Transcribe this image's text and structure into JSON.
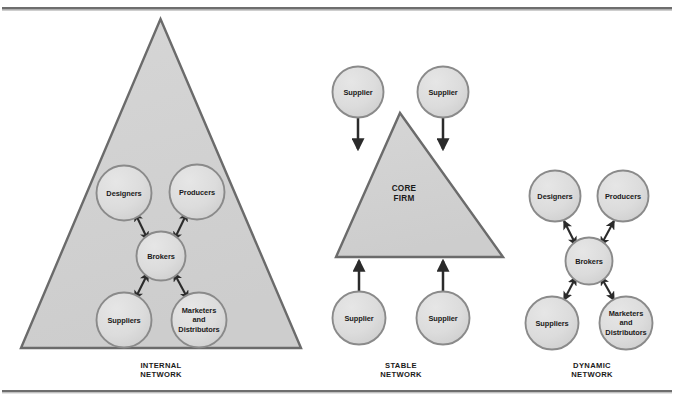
{
  "figure": {
    "type": "diagram",
    "diagram_kind": "organizational-network-forms",
    "panel_count": 3
  },
  "rules": {
    "top_rule": {
      "name": "top-divider"
    },
    "bottom_rule": {
      "name": "bottom-divider"
    }
  },
  "colors": {
    "triangle_fill": "#d2d2d2",
    "triangle_stroke": "#6b6b6b",
    "circle_fill": "#dcdcdc",
    "circle_stroke": "#8a8a8a",
    "arrow": "#2b2b2b",
    "text": "#1a1a1a",
    "rule": "#6e6e6e",
    "page_background": "#ffffff"
  },
  "panels": [
    {
      "id": "internal-network",
      "caption_lines": [
        "INTERNAL",
        "NETWORK"
      ],
      "has_triangle": true,
      "triangle_label": "",
      "nodes": [
        {
          "id": "designers",
          "lines": [
            "Designers"
          ]
        },
        {
          "id": "producers",
          "lines": [
            "Producers"
          ]
        },
        {
          "id": "brokers",
          "lines": [
            "Brokers"
          ]
        },
        {
          "id": "suppliers",
          "lines": [
            "Suppliers"
          ]
        },
        {
          "id": "marketers",
          "lines": [
            "Marketers",
            "and",
            "Distributors"
          ]
        }
      ],
      "connections": [
        {
          "from": "brokers",
          "to": "designers",
          "style": "double-arrow"
        },
        {
          "from": "brokers",
          "to": "producers",
          "style": "double-arrow"
        },
        {
          "from": "brokers",
          "to": "suppliers",
          "style": "double-arrow"
        },
        {
          "from": "brokers",
          "to": "marketers",
          "style": "double-arrow"
        }
      ]
    },
    {
      "id": "stable-network",
      "caption_lines": [
        "STABLE",
        "NETWORK"
      ],
      "has_triangle": true,
      "triangle_label_lines": [
        "CORE",
        "FIRM"
      ],
      "nodes": [
        {
          "id": "supplier-top-left",
          "lines": [
            "Supplier"
          ]
        },
        {
          "id": "supplier-top-right",
          "lines": [
            "Supplier"
          ]
        },
        {
          "id": "supplier-bottom-left",
          "lines": [
            "Supplier"
          ]
        },
        {
          "id": "supplier-bottom-right",
          "lines": [
            "Supplier"
          ]
        }
      ],
      "connections": [
        {
          "from": "supplier-top-left",
          "to": "core-firm",
          "style": "single-arrow-down"
        },
        {
          "from": "supplier-top-right",
          "to": "core-firm",
          "style": "single-arrow-down"
        },
        {
          "from": "supplier-bottom-left",
          "to": "core-firm",
          "style": "single-arrow-up"
        },
        {
          "from": "supplier-bottom-right",
          "to": "core-firm",
          "style": "single-arrow-up"
        }
      ]
    },
    {
      "id": "dynamic-network",
      "caption_lines": [
        "DYNAMIC",
        "NETWORK"
      ],
      "has_triangle": false,
      "nodes": [
        {
          "id": "designers",
          "lines": [
            "Designers"
          ]
        },
        {
          "id": "producers",
          "lines": [
            "Producers"
          ]
        },
        {
          "id": "brokers",
          "lines": [
            "Brokers"
          ]
        },
        {
          "id": "suppliers",
          "lines": [
            "Suppliers"
          ]
        },
        {
          "id": "marketers",
          "lines": [
            "Marketers",
            "and",
            "Distributors"
          ]
        }
      ],
      "connections": [
        {
          "from": "brokers",
          "to": "designers",
          "style": "double-arrow"
        },
        {
          "from": "brokers",
          "to": "producers",
          "style": "double-arrow"
        },
        {
          "from": "brokers",
          "to": "suppliers",
          "style": "double-arrow"
        },
        {
          "from": "brokers",
          "to": "marketers",
          "style": "double-arrow"
        }
      ]
    }
  ],
  "labels": {
    "designers": "Designers",
    "producers": "Producers",
    "brokers": "Brokers",
    "suppliers": "Suppliers",
    "marketers_1": "Marketers",
    "marketers_2": "and",
    "marketers_3": "Distributors",
    "supplier": "Supplier",
    "core_1": "CORE",
    "core_2": "FIRM",
    "internal_1": "INTERNAL",
    "internal_2": "NETWORK",
    "stable_1": "STABLE",
    "stable_2": "NETWORK",
    "dynamic_1": "DYNAMIC",
    "dynamic_2": "NETWORK"
  }
}
